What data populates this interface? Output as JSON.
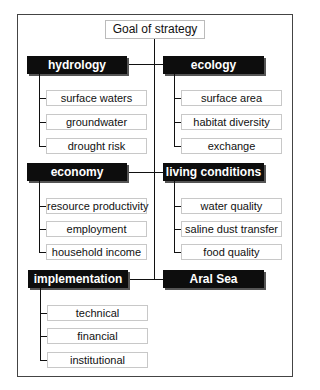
{
  "goal": {
    "label": "Goal of strategy"
  },
  "groups": {
    "hydrology": {
      "label": "hydrology",
      "items": [
        "surface waters",
        "groundwater",
        "drought risk"
      ]
    },
    "ecology": {
      "label": "ecology",
      "items": [
        "surface area",
        "habitat diversity",
        "exchange"
      ]
    },
    "economy": {
      "label": "economy",
      "items": [
        "resource productivity",
        "employment",
        "household income"
      ]
    },
    "living": {
      "label": "living conditions",
      "items": [
        "water quality",
        "saline dust transfer",
        "food quality"
      ]
    },
    "implementation": {
      "label": "implementation",
      "items": [
        "technical",
        "financial",
        "institutional"
      ]
    },
    "aral": {
      "label": "Aral Sea"
    }
  },
  "colors": {
    "header_bg": "#0d0d0d",
    "header_text": "#ffffff",
    "box_border": "#c8c8c8",
    "line": "#111111"
  }
}
